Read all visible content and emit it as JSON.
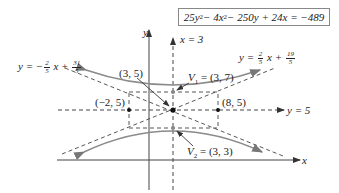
{
  "equation": {
    "text": "25y² − 4x² − 250y + 24x = −489",
    "parts": {
      "a": "25y",
      "b": " − 4x",
      "c": " − 250y + 24x = −489",
      "sq": "2"
    }
  },
  "axes": {
    "x_label": "x",
    "y_label": "y"
  },
  "lines": {
    "vertical_axis_label": "x = 3",
    "horizontal_axis_label": "y = 5",
    "asymptote_pos": {
      "prefix": "y = ",
      "num": "2",
      "den": "5",
      "mid": " x + ",
      "num2": "19",
      "den2": "5"
    },
    "asymptote_neg": {
      "prefix": "y = −",
      "num": "2",
      "den": "5",
      "mid": " x + ",
      "num2": "31",
      "den2": "5"
    }
  },
  "points": {
    "center": "(3, 5)",
    "v1_name": "V",
    "v1_sub": "1",
    "v1_val": " = (3, 7)",
    "v2_name": "V",
    "v2_sub": "2",
    "v2_val": " = (3, 3)",
    "left": "(−2, 5)",
    "right": "(8, 5)"
  },
  "colors": {
    "curve": "#8a8a8a",
    "dashed": "#555555",
    "axis": "#444444",
    "point": "#111111",
    "vertex": "#888888"
  }
}
